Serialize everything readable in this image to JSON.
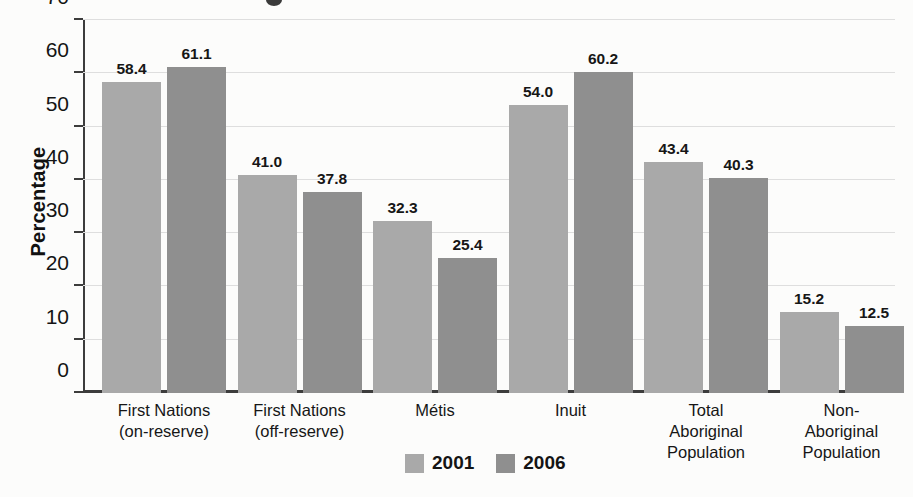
{
  "chart_data": {
    "type": "bar",
    "title": "",
    "subtitle": "",
    "xlabel": "",
    "ylabel": "Percentage",
    "ylim": [
      0,
      70
    ],
    "ytick_step": 10,
    "yticks": [
      0,
      10,
      20,
      30,
      40,
      50,
      60,
      70
    ],
    "ytick_labels": [
      "0",
      "10",
      "20",
      "30",
      "40",
      "50",
      "60",
      "70"
    ],
    "grid": "horizontal",
    "legend_position": "bottom-center",
    "categories": [
      [
        "First Nations",
        "(on-reserve)"
      ],
      [
        "First Nations",
        "(off-reserve)"
      ],
      [
        "Métis"
      ],
      [
        "Inuit"
      ],
      [
        "Total",
        "Aboriginal",
        "Population"
      ],
      [
        "Non-",
        "Aboriginal",
        "Population"
      ]
    ],
    "series": [
      {
        "name": "2001",
        "color": "#a9a9a9",
        "values": [
          58.4,
          41.0,
          32.3,
          54.0,
          43.4,
          15.2
        ],
        "labels": [
          "58.4",
          "41.0",
          "32.3",
          "54.0",
          "43.4",
          "15.2"
        ]
      },
      {
        "name": "2006",
        "color": "#8f8f8f",
        "values": [
          61.1,
          37.8,
          25.4,
          60.2,
          40.3,
          12.5
        ],
        "labels": [
          "61.1",
          "37.8",
          "25.4",
          "60.2",
          "40.3",
          "12.5"
        ]
      }
    ]
  },
  "colors": {
    "background": "#fcfcfb",
    "axis": "#3c3c3c",
    "gridline": "#dedede",
    "text": "#161616",
    "series_2001": "#a9a9a9",
    "series_2006": "#8f8f8f"
  }
}
